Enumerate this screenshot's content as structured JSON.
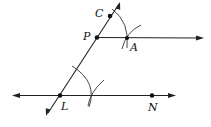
{
  "diagram": {
    "type": "geometric-construction",
    "points": {
      "C": {
        "label": "C",
        "x": 110,
        "y": 16
      },
      "P": {
        "label": "P",
        "x": 97,
        "y": 37
      },
      "A": {
        "label": "A",
        "x": 127,
        "y": 38
      },
      "L": {
        "label": "L",
        "x": 60,
        "y": 95
      },
      "N": {
        "label": "N",
        "x": 152,
        "y": 95
      }
    },
    "lines": [
      {
        "name": "transversal-LP",
        "through": [
          "L",
          "P",
          "C"
        ],
        "arrows": "both"
      },
      {
        "name": "ray-PA",
        "from": "P",
        "through": "A",
        "arrows": "end"
      },
      {
        "name": "line-LN",
        "through": [
          "L",
          "N"
        ],
        "arrows": "both"
      }
    ],
    "colors": {
      "stroke": "#222222",
      "background": "#ffffff"
    }
  }
}
